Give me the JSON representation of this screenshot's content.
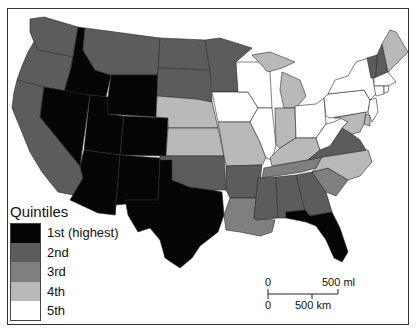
{
  "map": {
    "title": "Quintiles",
    "colors": {
      "q1": "#050505",
      "q2": "#5c5c5c",
      "q3": "#7f7f7f",
      "q4": "#b9b9b9",
      "q5": "#ffffff"
    }
  },
  "legend": {
    "title": "Quintiles",
    "items": [
      {
        "label": "1st (highest)",
        "color": "#050505"
      },
      {
        "label": "2nd",
        "color": "#5c5c5c"
      },
      {
        "label": "3rd",
        "color": "#7f7f7f"
      },
      {
        "label": "4th",
        "color": "#b9b9b9"
      },
      {
        "label": "5th",
        "color": "#ffffff"
      }
    ]
  },
  "scale_bar": {
    "miles_zero": "0",
    "miles_label": "500 ml",
    "km_zero": "0",
    "km_label": "500 km"
  },
  "states": [
    {
      "name": "WA",
      "quintile": 2
    },
    {
      "name": "OR",
      "quintile": 2
    },
    {
      "name": "CA",
      "quintile": 2
    },
    {
      "name": "ID",
      "quintile": 1
    },
    {
      "name": "NV",
      "quintile": 1
    },
    {
      "name": "UT",
      "quintile": 1
    },
    {
      "name": "AZ",
      "quintile": 1
    },
    {
      "name": "MT",
      "quintile": 2
    },
    {
      "name": "WY",
      "quintile": 1
    },
    {
      "name": "CO",
      "quintile": 1
    },
    {
      "name": "NM",
      "quintile": 1
    },
    {
      "name": "TX",
      "quintile": 1
    },
    {
      "name": "ND",
      "quintile": 2
    },
    {
      "name": "SD",
      "quintile": 2
    },
    {
      "name": "NE",
      "quintile": 4
    },
    {
      "name": "KS",
      "quintile": 4
    },
    {
      "name": "OK",
      "quintile": 2
    },
    {
      "name": "MN",
      "quintile": 2
    },
    {
      "name": "IA",
      "quintile": 5
    },
    {
      "name": "MO",
      "quintile": 4
    },
    {
      "name": "AR",
      "quintile": 2
    },
    {
      "name": "LA",
      "quintile": 3
    },
    {
      "name": "WI",
      "quintile": 5
    },
    {
      "name": "IL",
      "quintile": 5
    },
    {
      "name": "MI",
      "quintile": 4
    },
    {
      "name": "IN",
      "quintile": 4
    },
    {
      "name": "OH",
      "quintile": 5
    },
    {
      "name": "KY",
      "quintile": 4
    },
    {
      "name": "TN",
      "quintile": 3
    },
    {
      "name": "MS",
      "quintile": 2
    },
    {
      "name": "AL",
      "quintile": 2
    },
    {
      "name": "GA",
      "quintile": 2
    },
    {
      "name": "FL",
      "quintile": 1
    },
    {
      "name": "SC",
      "quintile": 3
    },
    {
      "name": "NC",
      "quintile": 4
    },
    {
      "name": "VA",
      "quintile": 2
    },
    {
      "name": "WV",
      "quintile": 5
    },
    {
      "name": "PA",
      "quintile": 5
    },
    {
      "name": "NY",
      "quintile": 5
    },
    {
      "name": "VT",
      "quintile": 2
    },
    {
      "name": "NH",
      "quintile": 2
    },
    {
      "name": "ME",
      "quintile": 4
    },
    {
      "name": "MA",
      "quintile": 5
    },
    {
      "name": "CT",
      "quintile": 5
    },
    {
      "name": "RI",
      "quintile": 5
    },
    {
      "name": "NJ",
      "quintile": 5
    },
    {
      "name": "DE",
      "quintile": 4
    },
    {
      "name": "MD",
      "quintile": 4
    }
  ]
}
